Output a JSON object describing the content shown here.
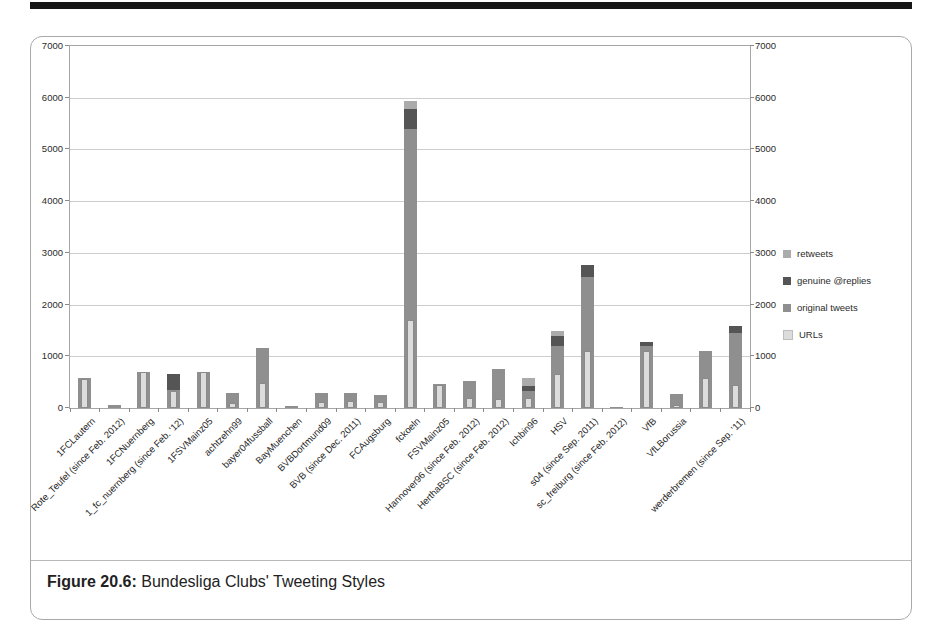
{
  "page": {
    "caption_label": "Figure 20.6:",
    "caption_text": " Bundesliga Clubs' Tweeting Styles"
  },
  "chart_data": {
    "type": "bar",
    "stacked": true,
    "title": "",
    "xlabel": "",
    "ylabel": "",
    "ylim": [
      0,
      7000
    ],
    "ytick_step": 1000,
    "yticks": [
      0,
      1000,
      2000,
      3000,
      4000,
      5000,
      6000,
      7000
    ],
    "right_axis_mirror": true,
    "grid": true,
    "legend_position": "right",
    "legend": [
      {
        "name": "retweets",
        "color": "#ababab"
      },
      {
        "name": "genuine @replies",
        "color": "#555555"
      },
      {
        "name": "original tweets",
        "color": "#8f8f8f"
      },
      {
        "name": "URLs",
        "color": "#dcdcdc"
      }
    ],
    "categories": [
      "1FCLautern",
      "Rote_Teufel (since Feb. 2012)",
      "1FCNuernberg",
      "1_fc_nuernberg (since Feb. '12)",
      "1FSVMainz05",
      "achtzehn99",
      "bayer04fussball",
      "BayMuenchen",
      "BVBDortmund09",
      "BVB (since Dec. 2011)",
      "FCAugsburg",
      "fckoeln",
      "FSVMainz05",
      "Hannover96 (since Feb. 2012)",
      "HerthaBSC (since Feb. 2012)",
      "Ichbin96",
      "HSV",
      "s04 (since Sep. 2011)",
      "sc_freiburg (since Feb. 2012)",
      "VfB",
      "VfLBorussia",
      "",
      "werderbremen (since Sep. '11)"
    ],
    "series": [
      {
        "name": "original tweets",
        "color": "#8f8f8f",
        "values": [
          580,
          50,
          700,
          350,
          700,
          290,
          1170,
          40,
          290,
          300,
          250,
          5400,
          460,
          530,
          750,
          330,
          1200,
          2530,
          20,
          1190,
          280,
          1100,
          1460
        ]
      },
      {
        "name": "genuine @replies",
        "color": "#555555",
        "values": [
          0,
          0,
          0,
          300,
          0,
          0,
          0,
          0,
          0,
          0,
          0,
          380,
          0,
          0,
          0,
          100,
          200,
          240,
          0,
          90,
          0,
          0,
          120
        ]
      },
      {
        "name": "retweets",
        "color": "#ababab",
        "values": [
          0,
          0,
          0,
          0,
          0,
          0,
          0,
          0,
          0,
          0,
          0,
          150,
          0,
          0,
          0,
          150,
          90,
          0,
          0,
          0,
          0,
          0,
          0
        ]
      },
      {
        "name": "URLs",
        "color": "#dcdcdc",
        "overlay": true,
        "values": [
          560,
          0,
          690,
          330,
          690,
          90,
          490,
          0,
          120,
          130,
          110,
          1700,
          440,
          200,
          170,
          200,
          660,
          1100,
          0,
          1100,
          60,
          590,
          450
        ]
      }
    ]
  }
}
